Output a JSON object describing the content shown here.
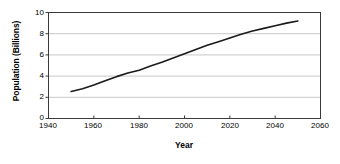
{
  "chart_data": {
    "type": "line",
    "title": "",
    "xlabel": "Year",
    "ylabel": "Population (Billions)",
    "xlim": [
      1940,
      2060
    ],
    "ylim": [
      0,
      10
    ],
    "xticks": [
      1940,
      1960,
      1980,
      2000,
      2020,
      2040,
      2060
    ],
    "yticks": [
      0,
      2,
      4,
      6,
      8,
      10
    ],
    "xtick_labels": [
      "1940",
      "1960",
      "1980",
      "2000",
      "2020",
      "2040",
      "2060"
    ],
    "ytick_labels": [
      "0",
      "2",
      "4",
      "6",
      "8",
      "10"
    ],
    "grid": "horizontal",
    "legend": "none",
    "series": [
      {
        "name": "World Population",
        "color": "#1a1a1a",
        "x": [
          1950,
          1955,
          1960,
          1965,
          1970,
          1975,
          1980,
          1985,
          1990,
          1995,
          2000,
          2005,
          2010,
          2015,
          2020,
          2025,
          2030,
          2035,
          2040,
          2045,
          2050
        ],
        "values": [
          2.55,
          2.8,
          3.15,
          3.55,
          3.95,
          4.3,
          4.55,
          4.95,
          5.3,
          5.7,
          6.1,
          6.5,
          6.9,
          7.25,
          7.6,
          7.95,
          8.25,
          8.5,
          8.75,
          9.0,
          9.2
        ]
      }
    ]
  },
  "axes": {
    "y_title": "Population (Billions)",
    "x_title": "Year"
  }
}
